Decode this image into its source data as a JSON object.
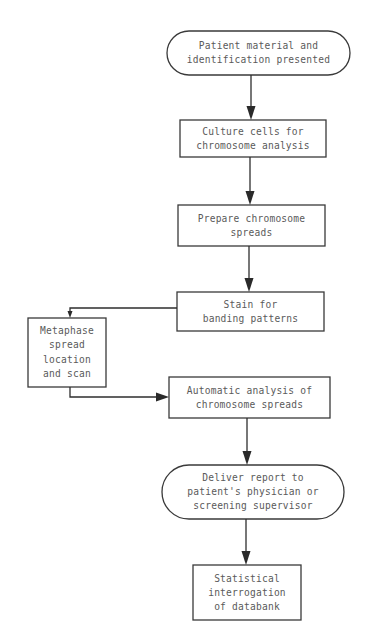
{
  "diagram": {
    "type": "flowchart",
    "colors": {
      "stroke": "#3a3a3a",
      "text": "#5a5a5a",
      "background": "#ffffff"
    },
    "nodes": [
      {
        "id": "patient",
        "shape": "terminal",
        "lines": [
          "Patient material and",
          "identification presented"
        ]
      },
      {
        "id": "culture",
        "shape": "process",
        "lines": [
          "Culture cells for",
          "chromosome analysis"
        ]
      },
      {
        "id": "prepare",
        "shape": "process",
        "lines": [
          "Prepare chromosome",
          "spreads"
        ]
      },
      {
        "id": "stain",
        "shape": "process",
        "lines": [
          "Stain for",
          "banding patterns"
        ]
      },
      {
        "id": "metaphase",
        "shape": "process",
        "lines": [
          "Metaphase",
          "spread",
          "location",
          "and scan"
        ]
      },
      {
        "id": "automatic",
        "shape": "process",
        "lines": [
          "Automatic analysis of",
          "chromosome spreads"
        ]
      },
      {
        "id": "deliver",
        "shape": "terminal",
        "lines": [
          "Deliver report to",
          "patient's physician or",
          "screening supervisor"
        ]
      },
      {
        "id": "statistical",
        "shape": "process",
        "lines": [
          "Statistical",
          "interrogation",
          "of databank"
        ]
      }
    ],
    "edges": [
      {
        "from": "patient",
        "to": "culture"
      },
      {
        "from": "culture",
        "to": "prepare"
      },
      {
        "from": "prepare",
        "to": "stain"
      },
      {
        "from": "stain",
        "to": "metaphase"
      },
      {
        "from": "metaphase",
        "to": "automatic"
      },
      {
        "from": "automatic",
        "to": "deliver"
      },
      {
        "from": "deliver",
        "to": "statistical"
      }
    ]
  }
}
